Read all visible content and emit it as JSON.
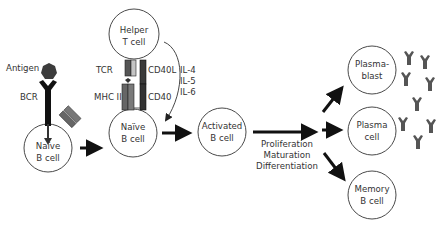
{
  "colors": {
    "outline": "#4a4a4a",
    "arrow": "#111111",
    "molecule_dark": "#3c3c3c",
    "molecule_mid": "#6e6e6e",
    "molecule_light": "#bdbdbd",
    "antibody": "#555555",
    "text": "#333333"
  },
  "cells": {
    "naive_b_cell_1": {
      "line1": "Naïve",
      "line2": "B cell"
    },
    "helper_t_cell": {
      "line1": "Helper",
      "line2": "T cell"
    },
    "naive_b_cell_2": {
      "line1": "Naïve",
      "line2": "B cell"
    },
    "activated_b_cell": {
      "line1": "Activated",
      "line2": "B cell"
    },
    "plasmablast": {
      "line1": "Plasma-",
      "line2": "blast"
    },
    "plasma_cell": {
      "line1": "Plasma",
      "line2": "cell"
    },
    "memory_b_cell": {
      "line1": "Memory",
      "line2": "B cell"
    }
  },
  "labels": {
    "antigen": "Antigen",
    "bcr": "BCR",
    "tcr": "TCR",
    "mhc_ii": "MHC II",
    "cd40l": "CD40L",
    "cd40": "CD40",
    "cytokines": [
      "IL-4",
      "IL-5",
      "IL-6"
    ],
    "process": [
      "Proliferation",
      "Maturation",
      "Differentiation"
    ]
  },
  "icons": {
    "antigen": "antigen-hexagon-icon",
    "bcr": "b-cell-receptor-icon",
    "mhc": "mhc-ii-molecule-icon",
    "antibody": "antibody-y-icon"
  }
}
